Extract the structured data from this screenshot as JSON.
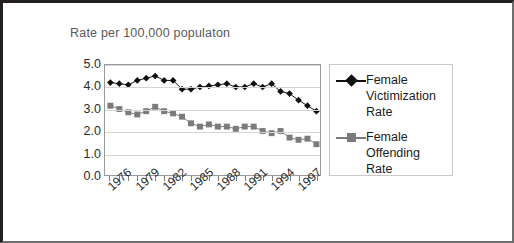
{
  "chart_data": {
    "type": "line",
    "title": "Rate per 100,000 populaton",
    "xlabel": "",
    "ylabel": "",
    "ylim": [
      0.0,
      5.0
    ],
    "ytick_step": 1.0,
    "ytick_labels": [
      "5.0",
      "4.0",
      "3.0",
      "2.0",
      "1.0",
      "0.0"
    ],
    "grid": true,
    "grid_axis": "y",
    "legend_position": "right",
    "x": [
      1976,
      1977,
      1978,
      1979,
      1980,
      1981,
      1982,
      1983,
      1984,
      1985,
      1986,
      1987,
      1988,
      1989,
      1990,
      1991,
      1992,
      1993,
      1994,
      1995,
      1996,
      1997,
      1998,
      1999
    ],
    "xtick_labels_shown": [
      "1976",
      "1979",
      "1982",
      "1985",
      "1988",
      "1991",
      "1994",
      "1997"
    ],
    "xtick_label_rotation": -42,
    "series": [
      {
        "name": "Female Victimization Rate",
        "marker": "diamond",
        "color": "#101010",
        "values": [
          4.2,
          4.15,
          4.1,
          4.3,
          4.4,
          4.5,
          4.3,
          4.3,
          3.9,
          3.9,
          4.0,
          4.05,
          4.1,
          4.15,
          4.0,
          4.0,
          4.15,
          4.0,
          4.15,
          3.8,
          3.7,
          3.4,
          3.15,
          2.9
        ]
      },
      {
        "name": "Female Offending Rate",
        "marker": "square",
        "color": "#7b7b7b",
        "values": [
          3.15,
          3.0,
          2.85,
          2.75,
          2.9,
          3.1,
          2.9,
          2.8,
          2.65,
          2.35,
          2.2,
          2.3,
          2.2,
          2.2,
          2.1,
          2.2,
          2.2,
          2.0,
          1.9,
          2.0,
          1.7,
          1.6,
          1.65,
          1.4
        ]
      }
    ]
  },
  "legend": {
    "entries": [
      {
        "label": "Female Victimization Rate"
      },
      {
        "label": "Female Offending Rate"
      }
    ]
  },
  "colors": {
    "victimization": "#101010",
    "offending": "#7b7b7b",
    "gridline": "#d4d4d4",
    "plot_border": "#9a9a9a",
    "title_text": "#58585a",
    "frame": "#231f20"
  }
}
